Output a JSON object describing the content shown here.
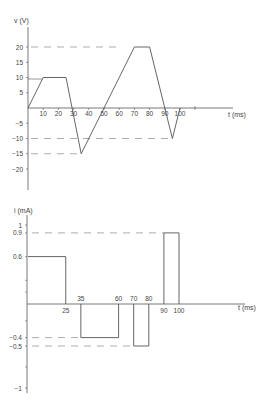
{
  "chart_data": [
    {
      "type": "line",
      "title": "",
      "ylabel": "v (V)",
      "xlabel": "t (ms)",
      "x_ticks": [
        10,
        20,
        30,
        40,
        50,
        60,
        70,
        80,
        90,
        100
      ],
      "y_ticks": [
        20,
        15,
        10,
        5,
        -5,
        -10,
        -15,
        -20
      ],
      "xlim": [
        0,
        135
      ],
      "ylim": [
        -27,
        27
      ],
      "grid": false,
      "series": [
        {
          "name": "v(t)",
          "x": [
            0,
            10,
            25,
            35,
            70,
            80,
            95,
            100
          ],
          "y": [
            0,
            10,
            10,
            -15,
            20,
            20,
            -10,
            0
          ]
        }
      ],
      "reference_lines": [
        {
          "y": 20,
          "x_from": 0,
          "x_to": 60,
          "style": "dashed"
        },
        {
          "y": -10,
          "x_from": 0,
          "x_to": 95,
          "style": "dashed"
        },
        {
          "y": -15,
          "x_from": 0,
          "x_to": 35,
          "style": "dashed"
        }
      ]
    },
    {
      "type": "line",
      "title": "",
      "ylabel": "i (mA)",
      "xlabel": "t (ms)",
      "x_tick_labels_above": [
        35,
        60,
        70,
        80
      ],
      "x_tick_labels_below": [
        25,
        90,
        100
      ],
      "y_ticks": [
        1.0,
        0.9,
        0.6,
        -0.4,
        -0.5,
        -1.0
      ],
      "xlim": [
        0,
        145
      ],
      "ylim": [
        -1.1,
        1.15
      ],
      "grid": false,
      "series": [
        {
          "name": "i(t)",
          "segments": [
            {
              "t_start": 0,
              "t_end": 25,
              "value": 0.6
            },
            {
              "t_start": 25,
              "t_end": 35,
              "value": 0
            },
            {
              "t_start": 35,
              "t_end": 60,
              "value": -0.4
            },
            {
              "t_start": 60,
              "t_end": 70,
              "value": 0
            },
            {
              "t_start": 70,
              "t_end": 80,
              "value": -0.5
            },
            {
              "t_start": 80,
              "t_end": 90,
              "value": 0
            },
            {
              "t_start": 90,
              "t_end": 100,
              "value": 0.9
            }
          ]
        }
      ],
      "reference_lines": [
        {
          "y": 0.9,
          "x_from": 0,
          "x_to": 90,
          "style": "dashed"
        },
        {
          "y": -0.4,
          "x_from": 0,
          "x_to": 35,
          "style": "dashed"
        },
        {
          "y": -0.5,
          "x_from": 0,
          "x_to": 70,
          "style": "dashed"
        }
      ]
    }
  ],
  "labels": {
    "top_ylabel": "v (V)",
    "top_xlabel": "t (ms)",
    "bottom_ylabel": "i (mA)",
    "bottom_xlabel": "t (ms)"
  },
  "colors": {
    "line": "#555555",
    "dash": "#8a8a8a",
    "text": "#444444"
  }
}
